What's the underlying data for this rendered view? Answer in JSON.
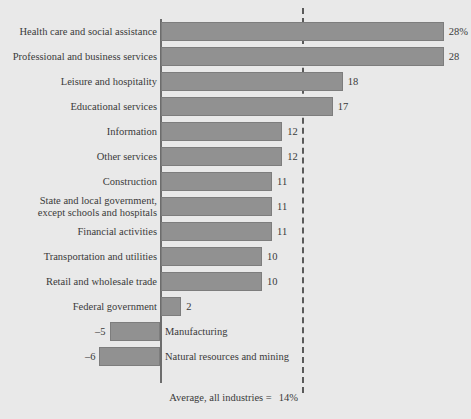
{
  "chart_data": {
    "type": "bar",
    "orientation": "horizontal",
    "title": "",
    "xlabel": "",
    "ylabel": "",
    "grid": false,
    "legend": null,
    "xlim": [
      -8,
      30
    ],
    "axis_zero_value": 0,
    "average_line": {
      "value": 14,
      "label": "Average, all industries =",
      "value_label": "14%",
      "style": "dashed"
    },
    "categories": [
      "Health care and social assistance",
      "Professional and business services",
      "Leisure and hospitality",
      "Educational services",
      "Information",
      "Other services",
      "Construction",
      "State and local government, except schools and hospitals",
      "Financial activities",
      "Transportation and utilities",
      "Retail and wholesale trade",
      "Federal government",
      "Manufacturing",
      "Natural resources and mining"
    ],
    "values": [
      28,
      28,
      18,
      17,
      12,
      12,
      11,
      11,
      11,
      10,
      10,
      2,
      -5,
      -6
    ],
    "value_labels": [
      "28%",
      "28",
      "18",
      "17",
      "12",
      "12",
      "11",
      "11",
      "11",
      "10",
      "10",
      "2",
      "–5",
      "–6"
    ],
    "bars": [
      {
        "category": "Health care and social assistance",
        "label_lines": [
          "Health care and social assistance"
        ],
        "value": 28,
        "value_label": "28%",
        "negative": false
      },
      {
        "category": "Professional and business services",
        "label_lines": [
          "Professional and business services"
        ],
        "value": 28,
        "value_label": "28",
        "negative": false
      },
      {
        "category": "Leisure and hospitality",
        "label_lines": [
          "Leisure and hospitality"
        ],
        "value": 18,
        "value_label": "18",
        "negative": false
      },
      {
        "category": "Educational services",
        "label_lines": [
          "Educational services"
        ],
        "value": 17,
        "value_label": "17",
        "negative": false
      },
      {
        "category": "Information",
        "label_lines": [
          "Information"
        ],
        "value": 12,
        "value_label": "12",
        "negative": false
      },
      {
        "category": "Other services",
        "label_lines": [
          "Other services"
        ],
        "value": 12,
        "value_label": "12",
        "negative": false
      },
      {
        "category": "Construction",
        "label_lines": [
          "Construction"
        ],
        "value": 11,
        "value_label": "11",
        "negative": false
      },
      {
        "category": "State and local government, except schools and hospitals",
        "label_lines": [
          "State and local government,",
          "except schools and hospitals"
        ],
        "value": 11,
        "value_label": "11",
        "negative": false
      },
      {
        "category": "Financial activities",
        "label_lines": [
          "Financial activities"
        ],
        "value": 11,
        "value_label": "11",
        "negative": false
      },
      {
        "category": "Transportation and utilities",
        "label_lines": [
          "Transportation and utilities"
        ],
        "value": 10,
        "value_label": "10",
        "negative": false
      },
      {
        "category": "Retail and wholesale trade",
        "label_lines": [
          "Retail and wholesale trade"
        ],
        "value": 10,
        "value_label": "10",
        "negative": false
      },
      {
        "category": "Federal government",
        "label_lines": [
          "Federal government"
        ],
        "value": 2,
        "value_label": "2",
        "negative": false
      },
      {
        "category": "Manufacturing",
        "label_lines": [
          "Manufacturing"
        ],
        "value": -5,
        "value_label": "–5",
        "negative": true
      },
      {
        "category": "Natural resources and mining",
        "label_lines": [
          "Natural resources and mining"
        ],
        "value": -6,
        "value_label": "–6",
        "negative": true
      }
    ]
  },
  "colors": {
    "background": "#e9e9e9",
    "bar_fill": "#919191",
    "bar_stroke": "#7d7d7d",
    "axis": "#6d6d6d",
    "average_line": "#5a5a5a",
    "text": "#3a3a3a"
  },
  "footnote": {
    "text": "Average, all industries =",
    "value": "14%"
  }
}
